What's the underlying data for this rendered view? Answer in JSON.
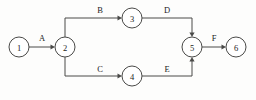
{
  "diagram": {
    "type": "activity-on-arrow-network",
    "title": "",
    "canvas": {
      "width": 256,
      "height": 100,
      "background": "#fdfdfc"
    },
    "colors": {
      "line": "#4a4a48",
      "node_fill": "#ffffff",
      "text": "#1c1c1c"
    },
    "node_radius": 10,
    "nodes": [
      {
        "id": "1",
        "label": "1",
        "cx": 19,
        "cy": 47
      },
      {
        "id": "2",
        "label": "2",
        "cx": 65,
        "cy": 47
      },
      {
        "id": "3",
        "label": "3",
        "cx": 132,
        "cy": 18
      },
      {
        "id": "4",
        "label": "4",
        "cx": 132,
        "cy": 76
      },
      {
        "id": "5",
        "label": "5",
        "cx": 192,
        "cy": 47
      },
      {
        "id": "6",
        "label": "6",
        "cx": 236,
        "cy": 47
      }
    ],
    "edges": [
      {
        "id": "A",
        "label": "A",
        "from": "1",
        "to": "2",
        "label_x": 42,
        "label_y": 41,
        "path": "M 29 47 L 53 47",
        "arrow": {
          "x": 55,
          "y": 47,
          "dir": "right"
        }
      },
      {
        "id": "B",
        "label": "B",
        "from": "2",
        "to": "3",
        "label_x": 100,
        "label_y": 13,
        "path": "M 65 37 L 65 18 L 120 18",
        "arrow": {
          "x": 122,
          "y": 18,
          "dir": "right"
        }
      },
      {
        "id": "C",
        "label": "C",
        "from": "2",
        "to": "4",
        "label_x": 100,
        "label_y": 72,
        "path": "M 65 57 L 65 76 L 120 76",
        "arrow": {
          "x": 122,
          "y": 76,
          "dir": "right"
        }
      },
      {
        "id": "D",
        "label": "D",
        "from": "3",
        "to": "5",
        "label_x": 167,
        "label_y": 13,
        "path": "M 142 18 L 192 18 L 192 35",
        "arrow": {
          "x": 192,
          "y": 37,
          "dir": "down"
        }
      },
      {
        "id": "E",
        "label": "E",
        "from": "4",
        "to": "5",
        "label_x": 167,
        "label_y": 72,
        "path": "M 142 76 L 192 76 L 192 59",
        "arrow": {
          "x": 192,
          "y": 57,
          "dir": "up"
        }
      },
      {
        "id": "F",
        "label": "F",
        "from": "5",
        "to": "6",
        "label_x": 214,
        "label_y": 41,
        "path": "M 202 47 L 224 47",
        "arrow": {
          "x": 226,
          "y": 47,
          "dir": "right"
        }
      }
    ]
  }
}
